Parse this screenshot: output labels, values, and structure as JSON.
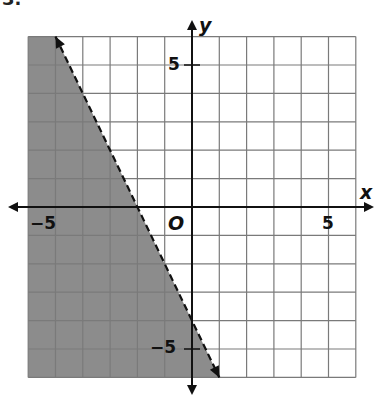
{
  "problem": {
    "number": "3."
  },
  "chart_data": {
    "type": "line",
    "title": "",
    "inequality": "y < -2x - 4",
    "boundary": {
      "style": "dashed",
      "slope": -2,
      "intercept": -4,
      "from": [
        -5,
        6
      ],
      "to": [
        1,
        -6
      ],
      "arrows": true
    },
    "shaded_region": "left of line (y < -2x - 4)",
    "xlabel": "x",
    "ylabel": "y",
    "origin_label": "O",
    "xlim": [
      -6,
      6
    ],
    "ylim": [
      -6,
      6
    ],
    "grid": true,
    "grid_step": 1,
    "x_tick_labels": [
      {
        "value": -5,
        "label": "−5"
      },
      {
        "value": 5,
        "label": "5"
      }
    ],
    "y_tick_labels": [
      {
        "value": 5,
        "label": "5"
      },
      {
        "value": -5,
        "label": "−5"
      }
    ],
    "colors": {
      "shade": "#8c8c8c",
      "grid": "#7a7a7a",
      "axis": "#111111",
      "line": "#111111"
    }
  }
}
